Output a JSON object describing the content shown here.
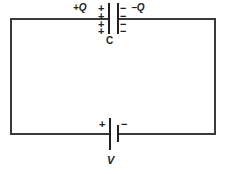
{
  "diagram": {
    "colors": {
      "background": "#ffffff",
      "wire": "#3a3a3a",
      "ink": "#231f20"
    },
    "capacitor": {
      "component_label": "C",
      "positive_charge_label": "+Q",
      "negative_charge_label": "−Q",
      "positive_plate_signs": [
        "+",
        "+",
        "+",
        "+"
      ],
      "negative_plate_signs": [
        "−",
        "−",
        "−",
        "−"
      ]
    },
    "battery": {
      "component_label": "V",
      "positive_terminal_label": "+",
      "negative_terminal_label": "−"
    },
    "footer": {
      "cut_off_text": ""
    }
  }
}
